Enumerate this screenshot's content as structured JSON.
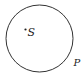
{
  "diagram": {
    "type": "circle-with-center-and-point",
    "circle": {
      "cx": 39.5,
      "cy": 38.5,
      "r": 33.5,
      "stroke": "#333333"
    },
    "center_point": {
      "label": "S",
      "x": 25.5,
      "y": 29.5
    },
    "circumference_point": {
      "label": "P"
    }
  }
}
